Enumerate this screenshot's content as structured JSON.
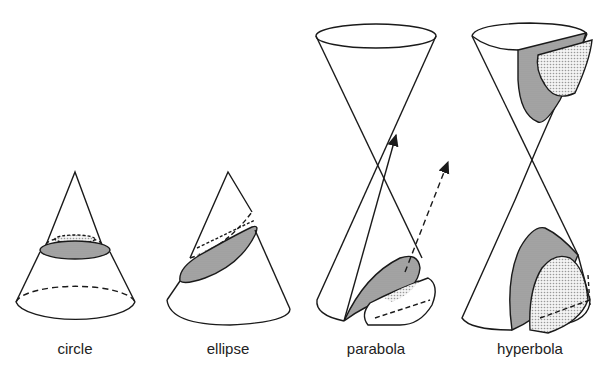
{
  "figure": {
    "top_text_cutoff": "",
    "colors": {
      "stroke": "#1a1a1a",
      "shade": "#b4b4b4",
      "dots": "#d8d8d8",
      "background": "#ffffff"
    },
    "sections": [
      {
        "id": "circle",
        "label": "circle"
      },
      {
        "id": "ellipse",
        "label": "ellipse"
      },
      {
        "id": "parabola",
        "label": "parabola"
      },
      {
        "id": "hyperbola",
        "label": "hyperbola"
      }
    ]
  }
}
